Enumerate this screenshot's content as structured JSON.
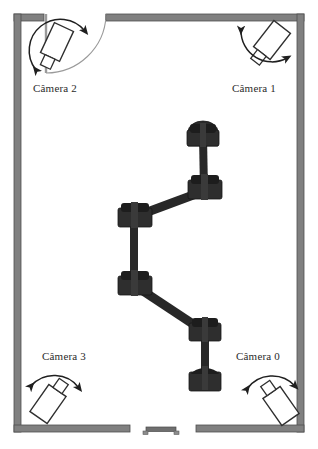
{
  "diagram": {
    "background_color": "#ffffff",
    "wall_color": "#808080",
    "wall_edge_color": "#5a5a5a",
    "robot_color": "#262626",
    "outline_color": "#3a3a3a",
    "room": {
      "x": 14,
      "y": 14,
      "width": 290,
      "height": 418,
      "wall_thickness": 7
    },
    "door": {
      "name": "door-top-left",
      "opening_x_start": 44,
      "opening_x_end": 106,
      "leaf_x": 45,
      "leaf_y_start": 14,
      "leaf_y_end": 72,
      "swing": "arc from leaf tip to opening right edge"
    },
    "bottom_gap": {
      "x_start": 130,
      "x_end": 196
    },
    "bench": {
      "x": 145,
      "y": 427,
      "width": 32,
      "height": 7,
      "label": "bench"
    }
  },
  "cameras": [
    {
      "id": "cam0",
      "label": "Câmera 0",
      "corner": "bottom-right",
      "label_x": 236,
      "label_y": 350,
      "body": {
        "cx": 281,
        "cy": 406,
        "w": 21,
        "h": 33,
        "rotation": -35
      },
      "lens": {
        "w": 11,
        "h": 11,
        "offset": -22
      },
      "arc": {
        "cx": 272,
        "cy": 380,
        "r": 29,
        "start_deg": 170,
        "end_deg": 15,
        "arrows": "both"
      }
    },
    {
      "id": "cam1",
      "label": "Câmera 1",
      "corner": "top-right",
      "label_x": 232,
      "label_y": 82,
      "body": {
        "cx": 272,
        "cy": 40,
        "w": 21,
        "h": 33,
        "rotation": 35
      },
      "lens": {
        "w": 11,
        "h": 11,
        "offset": 22
      },
      "arc": {
        "cx": 264,
        "cy": 52,
        "r": 29,
        "start_deg": 195,
        "end_deg": 350,
        "arrows": "both"
      }
    },
    {
      "id": "cam2",
      "label": "Câmera 2",
      "corner": "top-left",
      "label_x": 33,
      "label_y": 82,
      "body": {
        "cx": 57,
        "cy": 42,
        "w": 21,
        "h": 33,
        "rotation": 25
      },
      "lens": {
        "w": 11,
        "h": 11,
        "offset": 22
      },
      "arc": {
        "cx": 60,
        "cy": 48,
        "r": 27,
        "start_deg": 190,
        "end_deg": 345,
        "arrows": "both"
      }
    },
    {
      "id": "cam3",
      "label": "Câmera 3",
      "corner": "bottom-left",
      "label_x": 42,
      "label_y": 350,
      "body": {
        "cx": 49,
        "cy": 403,
        "w": 21,
        "h": 33,
        "rotation": 35
      },
      "lens": {
        "w": 11,
        "h": 11,
        "offset": -22
      },
      "arc": {
        "cx": 56,
        "cy": 382,
        "r": 29,
        "start_deg": 168,
        "end_deg": 13,
        "arrows": "both"
      }
    }
  ],
  "robot_chain": {
    "name": "robotic-arm-chain",
    "joint_count": 6,
    "joints": [
      {
        "id": "joint-1",
        "x": 203,
        "y": 134,
        "w": 31,
        "h": 23
      },
      {
        "id": "joint-2",
        "x": 204,
        "y": 189,
        "w": 33,
        "h": 24
      },
      {
        "id": "joint-3",
        "x": 134,
        "y": 216,
        "w": 33,
        "h": 24
      },
      {
        "id": "joint-4",
        "x": 134,
        "y": 284,
        "w": 33,
        "h": 24
      },
      {
        "id": "joint-5",
        "x": 205,
        "y": 331,
        "w": 31,
        "h": 23
      },
      {
        "id": "joint-6",
        "x": 205,
        "y": 379,
        "w": 31,
        "h": 23
      }
    ],
    "links": [
      {
        "id": "link-1-2",
        "from": "joint-1",
        "to": "joint-2",
        "width": 8
      },
      {
        "id": "link-2-3",
        "from": "joint-2",
        "to": "joint-3",
        "width": 9
      },
      {
        "id": "link-3-4",
        "from": "joint-3",
        "to": "joint-4",
        "width": 8
      },
      {
        "id": "link-4-5",
        "from": "joint-4",
        "to": "joint-5",
        "width": 9
      },
      {
        "id": "link-5-6",
        "from": "joint-5",
        "to": "joint-6",
        "width": 8
      }
    ]
  }
}
